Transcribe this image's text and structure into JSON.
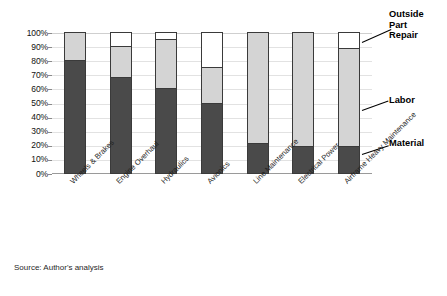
{
  "chart_data": {
    "type": "bar",
    "subtype": "stacked-100-percent",
    "title": "",
    "xlabel": "",
    "ylabel": "",
    "ylim": [
      0,
      100
    ],
    "grid": true,
    "legend_position": "right-callouts",
    "categories": [
      "Wheels & Brakes",
      "Engine Overhaul",
      "Hydraulics",
      "Avionics",
      "Line Maintenance",
      "Electrical Power",
      "Airframe Heavy Maintenance"
    ],
    "y_ticks": [
      "0%",
      "10%",
      "20%",
      "30%",
      "40%",
      "50%",
      "60%",
      "70%",
      "80%",
      "90%",
      "100%"
    ],
    "y_tick_values": [
      0,
      10,
      20,
      30,
      40,
      50,
      60,
      70,
      80,
      90,
      100
    ],
    "series": [
      {
        "name": "Material",
        "color": "#4a4a4a",
        "values": [
          80,
          68,
          60,
          50,
          21,
          19,
          19
        ]
      },
      {
        "name": "Labor",
        "color": "#d4d4d4",
        "values": [
          20,
          22,
          35,
          25,
          79,
          81,
          70
        ]
      },
      {
        "name": "Outside Part Repair",
        "color": "#ffffff",
        "values": [
          0,
          10,
          5,
          25,
          0,
          0,
          11
        ]
      }
    ],
    "source": "Source: Author's analysis"
  },
  "callouts": {
    "outside_part_repair": "Outside\nPart\nRepair",
    "labor": "Labor",
    "material": "Material"
  },
  "colors": {
    "material": "#4a4a4a",
    "labor": "#d4d4d4",
    "outside_part_repair": "#ffffff",
    "outline": "#3a3a3a",
    "gridline": "#e2e2e2",
    "axis": "#9a9a9a",
    "background": "#ffffff"
  },
  "source_note": "Source: Author's analysis"
}
